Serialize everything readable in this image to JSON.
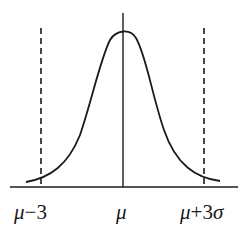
{
  "diagram": {
    "type": "normal-distribution-curve",
    "labels": {
      "left": {
        "mu": "μ",
        "rest": "−3"
      },
      "center": {
        "mu": "μ"
      },
      "right": {
        "mu": "μ",
        "rest": "+3",
        "sigma": "σ"
      }
    },
    "colors": {
      "stroke": "#1a1a1a",
      "background": "#ffffff"
    }
  }
}
